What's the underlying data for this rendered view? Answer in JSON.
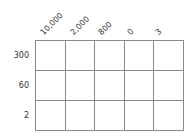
{
  "columns": [
    "10,000",
    "2,000",
    "800",
    "0",
    "3"
  ],
  "rows": [
    "300",
    "60",
    "2"
  ],
  "colors": {
    "grid_line": "#8a8a8a",
    "text": "#333333",
    "background": "#ffffff"
  }
}
